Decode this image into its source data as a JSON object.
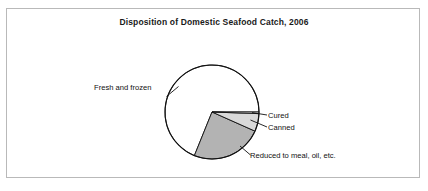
{
  "figure": {
    "title": "Disposition of Domestic Seafood Catch, 2006",
    "border_color": "#b9b9b9",
    "background": "#ffffff"
  },
  "labels": {
    "fresh": "Fresh and frozen",
    "cured": "Cured",
    "canned": "Canned",
    "reduced": "Reduced to meal, oil, etc."
  },
  "chart_data": {
    "type": "pie",
    "title": "Disposition of Domestic Seafood Catch, 2006",
    "xlabel": "",
    "ylabel": "",
    "legend_position": "none",
    "grid": false,
    "units": "percent of domestic seafood catch",
    "start_angle_deg": 0,
    "direction": "clockwise",
    "center_px": [
      212,
      112
    ],
    "radius_px": 47,
    "categories": [
      "Cured",
      "Canned",
      "Reduced to meal, oil, etc.",
      "Fresh and frozen"
    ],
    "values": [
      0.6,
      6.1,
      24.4,
      68.9
    ],
    "angles_deg": [
      2,
      22,
      88,
      248
    ],
    "colors": [
      "#ffffff",
      "#d9d9d9",
      "#b3b3b3",
      "#ffffff"
    ],
    "slices": [
      {
        "name": "Cured",
        "value": 0.6,
        "angle_deg": 2,
        "color": "#ffffff",
        "label_side": "right"
      },
      {
        "name": "Canned",
        "value": 6.1,
        "angle_deg": 22,
        "color": "#d9d9d9",
        "label_side": "right"
      },
      {
        "name": "Reduced to meal, oil, etc.",
        "value": 24.4,
        "angle_deg": 88,
        "color": "#b3b3b3",
        "label_side": "bottom-right"
      },
      {
        "name": "Fresh and frozen",
        "value": 68.9,
        "angle_deg": 248,
        "color": "#ffffff",
        "label_side": "left"
      }
    ]
  }
}
